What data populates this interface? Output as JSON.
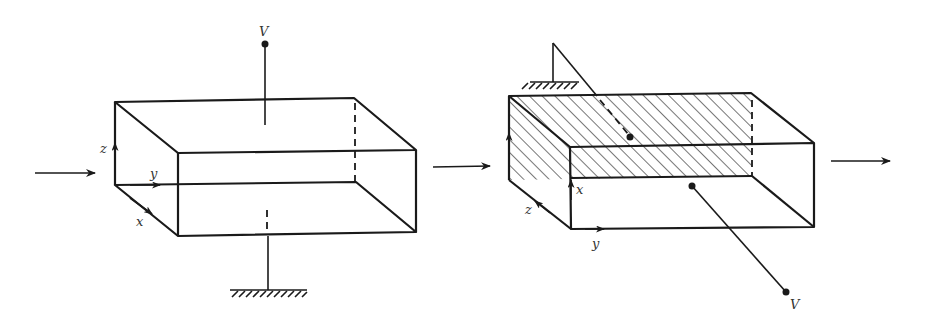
{
  "figures": [
    {
      "id": "left",
      "description": "Parallel-plate waveguide section with plates on top and bottom faces",
      "labels": {
        "terminal": "V",
        "axis_x": "x",
        "axis_y": "y",
        "axis_z": "z"
      }
    },
    {
      "id": "right",
      "description": "Waveguide section rotated; hatched plates on side faces",
      "labels": {
        "terminal": "V",
        "axis_x": "x",
        "axis_y": "y",
        "axis_z": "z"
      }
    }
  ],
  "colors": {
    "ink": "#1a1a1a",
    "background": "#ffffff"
  }
}
